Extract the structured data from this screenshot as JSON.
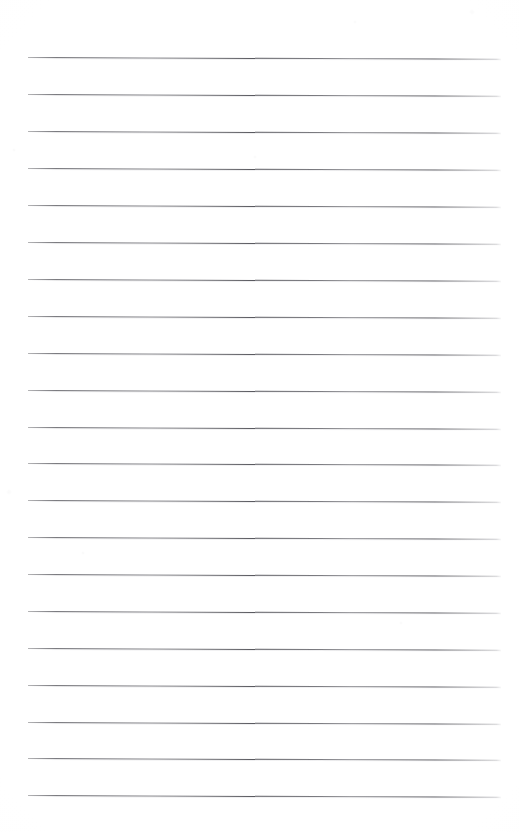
{
  "document": {
    "type": "ruled-notepad-page",
    "title": "Blank Lined Notepad Page",
    "page_width": 519,
    "page_height": 832,
    "background_color": "#ffffff",
    "paper_tone_color": "#fdfdfd",
    "text_content": "",
    "has_handwriting": false,
    "has_margin_line": false,
    "has_header": false,
    "has_footer": false,
    "page_number_label": ""
  },
  "ruling": {
    "line_color": "#5c5c62",
    "line_color_light": "#9a9aa0",
    "line_thickness_px": 1,
    "line_count": 21,
    "line_start_x": 28,
    "line_end_x": 501,
    "line_length_px": 473,
    "first_line_y": 57,
    "last_line_y": 795,
    "line_spacing_px": 36.9,
    "skew_degrees": 0.22,
    "lines": [
      {
        "index": 1,
        "y": 57,
        "x1": 28,
        "x2": 501
      },
      {
        "index": 2,
        "y": 94,
        "x1": 28,
        "x2": 501
      },
      {
        "index": 3,
        "y": 131,
        "x1": 28,
        "x2": 501
      },
      {
        "index": 4,
        "y": 168,
        "x1": 28,
        "x2": 501
      },
      {
        "index": 5,
        "y": 205,
        "x1": 28,
        "x2": 501
      },
      {
        "index": 6,
        "y": 242,
        "x1": 28,
        "x2": 501
      },
      {
        "index": 7,
        "y": 279,
        "x1": 28,
        "x2": 501
      },
      {
        "index": 8,
        "y": 316,
        "x1": 28,
        "x2": 501
      },
      {
        "index": 9,
        "y": 353,
        "x1": 28,
        "x2": 501
      },
      {
        "index": 10,
        "y": 390,
        "x1": 28,
        "x2": 501
      },
      {
        "index": 11,
        "y": 427,
        "x1": 28,
        "x2": 501
      },
      {
        "index": 12,
        "y": 463,
        "x1": 28,
        "x2": 501
      },
      {
        "index": 13,
        "y": 500,
        "x1": 28,
        "x2": 501
      },
      {
        "index": 14,
        "y": 537,
        "x1": 28,
        "x2": 501
      },
      {
        "index": 15,
        "y": 574,
        "x1": 28,
        "x2": 501
      },
      {
        "index": 16,
        "y": 611,
        "x1": 28,
        "x2": 501
      },
      {
        "index": 17,
        "y": 648,
        "x1": 28,
        "x2": 501
      },
      {
        "index": 18,
        "y": 685,
        "x1": 28,
        "x2": 501
      },
      {
        "index": 19,
        "y": 722,
        "x1": 28,
        "x2": 501
      },
      {
        "index": 20,
        "y": 758,
        "x1": 28,
        "x2": 501
      },
      {
        "index": 21,
        "y": 795,
        "x1": 28,
        "x2": 501
      }
    ]
  }
}
